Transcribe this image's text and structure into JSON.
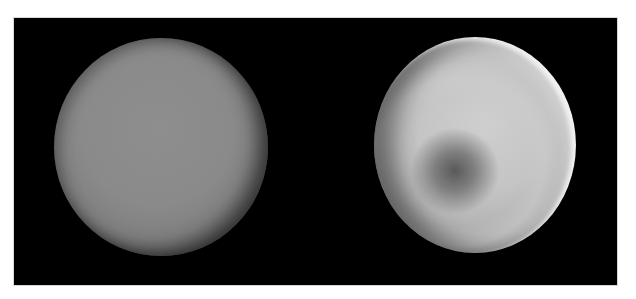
{
  "image": {
    "description": "Two side-by-side images of a planet (Venus-like) on a black background",
    "panels": [
      {
        "id": "left",
        "subject": "planet-disk",
        "appearance": "uniform medium-gray disk with darkened limb",
        "colors": {
          "center": "#8a8a8a",
          "limb": "#2e2e2e"
        }
      },
      {
        "id": "right",
        "subject": "planet-disk",
        "appearance": "light-gray disk with bright upper-right rim, dark spot lower-left of center, bright band surrounding the spot",
        "colors": {
          "center": "#c4c4c4",
          "spot": "#5a5a5a",
          "rim": "#f0f0f0"
        }
      }
    ],
    "background": "#000000",
    "border": "#ffffff"
  }
}
